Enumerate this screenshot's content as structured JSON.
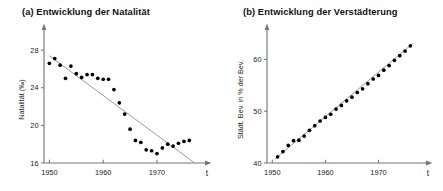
{
  "figure": {
    "background": "#ffffff",
    "point_color": "#000000",
    "line_color": "#9a9a9a",
    "axis_color": "#777777"
  },
  "panels": [
    {
      "key": "a",
      "title": "(a) Entwicklung der Natalität",
      "xlabel_symbol": "t",
      "ylabel": "Natalität (‰)",
      "xticks": [
        "1950",
        "1960",
        "1970"
      ],
      "yticks": [
        "28",
        "24",
        "20",
        "16"
      ]
    },
    {
      "key": "b",
      "title": "(b) Entwicklung der Verstädterung",
      "xlabel_symbol": "t",
      "ylabel": "Städt. Bev. in % der Bev.",
      "xticks": [
        "1950",
        "1960",
        "1970"
      ],
      "yticks": [
        "60",
        "50",
        "40"
      ]
    }
  ],
  "chart_data": [
    {
      "type": "scatter",
      "title": "(a) Entwicklung der Natalität",
      "xlabel": "t",
      "ylabel": "Natalität (‰)",
      "xlim": [
        1949,
        1978
      ],
      "ylim": [
        16,
        29.5
      ],
      "xticks": [
        1950,
        1960,
        1970
      ],
      "yticks": [
        16,
        20,
        24,
        28
      ],
      "grid": false,
      "legend": "none",
      "series": [
        {
          "name": "Natalität",
          "x": [
            1950,
            1951,
            1952,
            1953,
            1954,
            1955,
            1956,
            1957,
            1958,
            1959,
            1960,
            1961,
            1962,
            1963,
            1964,
            1965,
            1966,
            1967,
            1968,
            1969,
            1970,
            1971,
            1972,
            1973,
            1974,
            1975,
            1976
          ],
          "y": [
            26.6,
            27.1,
            26.4,
            25.0,
            26.3,
            25.5,
            25.1,
            25.4,
            25.4,
            25.0,
            24.9,
            24.9,
            23.8,
            22.4,
            21.2,
            19.6,
            18.4,
            18.2,
            17.4,
            17.3,
            17.0,
            17.6,
            18.0,
            17.8,
            18.1,
            18.3,
            18.4
          ]
        }
      ],
      "trendline": {
        "name": "Regressionsgerade",
        "x": [
          1950,
          1977
        ],
        "y": [
          27.4,
          16.0
        ]
      }
    },
    {
      "type": "scatter",
      "title": "(b) Entwicklung der Verstädterung",
      "xlabel": "t",
      "ylabel": "Städt. Bev. in % der Bev.",
      "xlim": [
        1949,
        1978
      ],
      "ylim": [
        40,
        64.5
      ],
      "xticks": [
        1950,
        1960,
        1970
      ],
      "yticks": [
        40,
        50,
        60
      ],
      "grid": false,
      "legend": "none",
      "series": [
        {
          "name": "Städtische Bevölkerung",
          "x": [
            1951,
            1952,
            1953,
            1954,
            1955,
            1956,
            1957,
            1958,
            1959,
            1960,
            1961,
            1962,
            1963,
            1964,
            1965,
            1966,
            1967,
            1968,
            1969,
            1970,
            1971,
            1972,
            1973,
            1974,
            1975,
            1976
          ],
          "y": [
            41.2,
            42.2,
            43.4,
            44.3,
            44.4,
            45.2,
            46.3,
            47.2,
            48.1,
            48.8,
            49.4,
            50.4,
            51.1,
            52.0,
            52.7,
            53.6,
            54.3,
            55.3,
            56.2,
            56.9,
            57.9,
            58.8,
            59.8,
            60.7,
            61.6,
            62.6
          ]
        }
      ],
      "trendline": {
        "name": "Regressionsgerade",
        "x": [
          1950.5,
          1976.5
        ],
        "y": [
          40.8,
          63.1
        ]
      }
    }
  ]
}
